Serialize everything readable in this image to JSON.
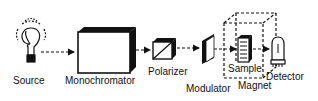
{
  "diagram": {
    "type": "optical-setup-schematic",
    "components": [
      {
        "id": "source",
        "label": "Source",
        "icon": "light-bulb-icon"
      },
      {
        "id": "monochromator",
        "label": "Monochromator",
        "icon": "box-icon"
      },
      {
        "id": "polarizer",
        "label": "Polarizer",
        "icon": "polarizer-cube-icon"
      },
      {
        "id": "modulator",
        "label": "Modulator",
        "icon": "modulator-plate-icon"
      },
      {
        "id": "sample",
        "label": "Sample",
        "icon": "sample-holder-icon"
      },
      {
        "id": "magnet",
        "label": "Magnet",
        "icon": "dashed-box-icon"
      },
      {
        "id": "detector",
        "label": "Detector",
        "icon": "photomultiplier-tube-icon"
      }
    ],
    "connections": [
      {
        "from": "source",
        "to": "monochromator",
        "style": "dashed-arrow"
      },
      {
        "from": "monochromator",
        "to": "polarizer",
        "style": "dashed-arrow"
      },
      {
        "from": "polarizer",
        "to": "modulator",
        "style": "dashed-arrow"
      },
      {
        "from": "modulator",
        "to": "sample",
        "style": "dashed-arrow"
      },
      {
        "from": "sample",
        "to": "detector",
        "style": "dashed-arrow"
      }
    ],
    "colors": {
      "stroke": "#111111",
      "background": "#ffffff"
    }
  }
}
